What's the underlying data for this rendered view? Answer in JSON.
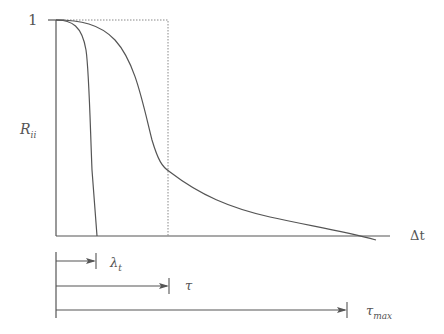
{
  "diagram": {
    "y_axis_top_label": "1",
    "y_axis_label": "R",
    "y_axis_label_sub": "ii",
    "x_axis_label": "Δt",
    "curves": [
      {
        "name": "fast-decay",
        "description": "steep drop from 1 to 0 at λ_t"
      },
      {
        "name": "slow-decay",
        "description": "gradual decay crossing zero near τ_max"
      }
    ],
    "intervals": [
      {
        "label": "λ",
        "sub": "t"
      },
      {
        "label": "τ",
        "sub": ""
      },
      {
        "label": "τ",
        "sub": "max"
      }
    ],
    "colors": {
      "line": "#555555",
      "dotted": "#888888"
    }
  }
}
